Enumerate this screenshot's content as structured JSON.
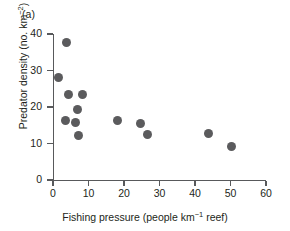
{
  "panel": {
    "label": "(a)"
  },
  "chart_data": {
    "type": "scatter",
    "title": "",
    "panel_label": "(a)",
    "xlabel": "Fishing pressure (people km⁻¹ reef)",
    "ylabel": "Predator density (no. km⁻²)",
    "xlabel_parts": {
      "pre": "Fishing pressure (people km",
      "sup": "−1",
      "post": " reef)"
    },
    "ylabel_parts": {
      "pre": "Predator density (no. km",
      "sup": "−2",
      "post": ")"
    },
    "xlim": [
      0,
      60
    ],
    "ylim": [
      0,
      40
    ],
    "xticks": [
      0,
      10,
      20,
      30,
      40,
      50,
      60
    ],
    "yticks": [
      0,
      10,
      20,
      30,
      40
    ],
    "xticklabels": [
      "0",
      "10",
      "20",
      "30",
      "40",
      "50",
      "60"
    ],
    "yticklabels": [
      "0",
      "10",
      "20",
      "30",
      "40"
    ],
    "grid": false,
    "legend": false,
    "marker": {
      "shape": "circle",
      "color": "#5b5b5d",
      "size_px": 9
    },
    "points": [
      {
        "x": 3.7,
        "y": 37.8
      },
      {
        "x": 1.5,
        "y": 28.0
      },
      {
        "x": 4.3,
        "y": 23.4
      },
      {
        "x": 8.2,
        "y": 23.4
      },
      {
        "x": 6.8,
        "y": 19.3
      },
      {
        "x": 3.6,
        "y": 16.4
      },
      {
        "x": 6.2,
        "y": 15.7
      },
      {
        "x": 7.3,
        "y": 12.1
      },
      {
        "x": 18.3,
        "y": 16.2
      },
      {
        "x": 24.6,
        "y": 15.6
      },
      {
        "x": 26.5,
        "y": 12.4
      },
      {
        "x": 43.8,
        "y": 12.8
      },
      {
        "x": 50.2,
        "y": 9.1
      }
    ],
    "n_points": 13,
    "axis_color": "#58595b"
  }
}
